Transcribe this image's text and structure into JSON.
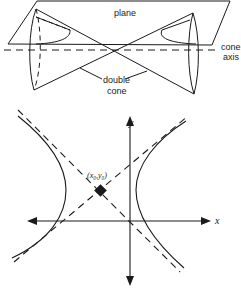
{
  "top_figure": {
    "labels": {
      "plane": "plane",
      "cone_axis_line1": "cone",
      "cone_axis_line2": "axis",
      "double_cone_line1": "double",
      "double_cone_line2": "cone"
    }
  },
  "bottom_figure": {
    "labels": {
      "y_axis": "y",
      "x_axis": "x",
      "center_point": "(x₀,y₀)"
    }
  },
  "colors": {
    "stroke": "#1a1a1a",
    "background": "#ffffff"
  }
}
